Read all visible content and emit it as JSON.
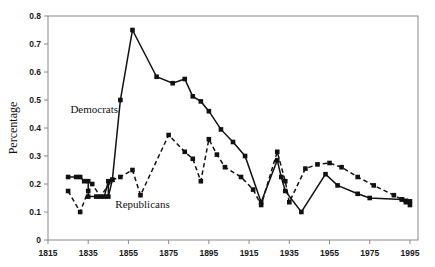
{
  "chart_data": {
    "type": "line",
    "title": "",
    "xlabel": "",
    "ylabel": "Percentage",
    "xlim": [
      1815,
      1999
    ],
    "ylim": [
      0,
      0.8
    ],
    "grid": false,
    "legend_position": "inline-annotation",
    "x_ticks": [
      1815,
      1835,
      1855,
      1875,
      1895,
      1915,
      1935,
      1955,
      1975,
      1995
    ],
    "x_tick_labels": [
      "1815",
      "1835",
      "1855",
      "1875",
      "1895",
      "1915",
      "1935",
      "1955",
      "1975",
      "1995"
    ],
    "y_ticks": [
      0,
      0.1,
      0.2,
      0.3,
      0.4,
      0.5,
      0.6,
      0.7,
      0.8
    ],
    "y_tick_labels": [
      "0",
      "0.1",
      "0.2",
      "0.3",
      "0.4",
      "0.5",
      "0.6",
      "0.7",
      "0.8"
    ],
    "series": [
      {
        "name": "Democrats",
        "style": "solid",
        "marker": "square",
        "color": "#111111",
        "points": [
          [
            1825,
            0.225
          ],
          [
            1829,
            0.225
          ],
          [
            1831,
            0.225
          ],
          [
            1833,
            0.21
          ],
          [
            1835,
            0.21
          ],
          [
            1835,
            0.155
          ],
          [
            1839,
            0.155
          ],
          [
            1843,
            0.155
          ],
          [
            1845,
            0.21
          ],
          [
            1845,
            0.155
          ],
          [
            1847,
            0.215
          ],
          [
            1851,
            0.5
          ],
          [
            1857,
            0.75
          ],
          [
            1869,
            0.583
          ],
          [
            1877,
            0.56
          ],
          [
            1883,
            0.575
          ],
          [
            1887,
            0.513
          ],
          [
            1891,
            0.495
          ],
          [
            1895,
            0.46
          ],
          [
            1901,
            0.395
          ],
          [
            1907,
            0.35
          ],
          [
            1913,
            0.3
          ],
          [
            1921,
            0.135
          ],
          [
            1929,
            0.285
          ],
          [
            1931,
            0.225
          ],
          [
            1933,
            0.175
          ],
          [
            1941,
            0.1
          ],
          [
            1953,
            0.235
          ],
          [
            1959,
            0.195
          ],
          [
            1969,
            0.165
          ],
          [
            1975,
            0.15
          ],
          [
            1991,
            0.145
          ],
          [
            1993,
            0.135
          ],
          [
            1995,
            0.125
          ]
        ]
      },
      {
        "name": "Republicans",
        "style": "dashed",
        "marker": "square",
        "color": "#111111",
        "points": [
          [
            1825,
            0.175
          ],
          [
            1831,
            0.1
          ],
          [
            1835,
            0.175
          ],
          [
            1837,
            0.2
          ],
          [
            1841,
            0.155
          ],
          [
            1847,
            0.215
          ],
          [
            1851,
            0.225
          ],
          [
            1857,
            0.25
          ],
          [
            1861,
            0.16
          ],
          [
            1875,
            0.375
          ],
          [
            1883,
            0.315
          ],
          [
            1887,
            0.29
          ],
          [
            1891,
            0.21
          ],
          [
            1895,
            0.36
          ],
          [
            1899,
            0.305
          ],
          [
            1903,
            0.26
          ],
          [
            1911,
            0.225
          ],
          [
            1917,
            0.18
          ],
          [
            1921,
            0.125
          ],
          [
            1929,
            0.315
          ],
          [
            1933,
            0.21
          ],
          [
            1935,
            0.135
          ],
          [
            1943,
            0.255
          ],
          [
            1949,
            0.27
          ],
          [
            1955,
            0.275
          ],
          [
            1961,
            0.26
          ],
          [
            1969,
            0.225
          ],
          [
            1977,
            0.195
          ],
          [
            1987,
            0.16
          ],
          [
            1991,
            0.145
          ],
          [
            1993,
            0.14
          ],
          [
            1995,
            0.138
          ]
        ]
      }
    ],
    "annotations": [
      {
        "text": "Democrats",
        "x": 1838,
        "y": 0.455
      },
      {
        "text": "Republicans",
        "x": 1862,
        "y": 0.115
      }
    ]
  },
  "axes": {
    "y_axis_title": "Percentage"
  }
}
